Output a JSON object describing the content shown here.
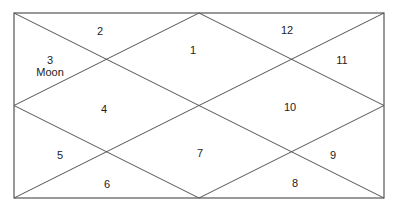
{
  "chart": {
    "type": "north-indian-horoscope",
    "line_color": "#555555",
    "frame": {
      "x1": 14,
      "y1": 13,
      "x2": 384,
      "y2": 198
    }
  },
  "houses": [
    {
      "number": "1",
      "planet": "",
      "x": 193,
      "y": 50
    },
    {
      "number": "2",
      "planet": "",
      "x": 100,
      "y": 31
    },
    {
      "number": "3",
      "planet": "Moon",
      "x": 50,
      "y": 66
    },
    {
      "number": "4",
      "planet": "",
      "x": 104,
      "y": 109
    },
    {
      "number": "5",
      "planet": "",
      "x": 60,
      "y": 155
    },
    {
      "number": "6",
      "planet": "",
      "x": 107,
      "y": 184
    },
    {
      "number": "7",
      "planet": "",
      "x": 200,
      "y": 153
    },
    {
      "number": "8",
      "planet": "",
      "x": 295,
      "y": 183
    },
    {
      "number": "9",
      "planet": "",
      "x": 333,
      "y": 155
    },
    {
      "number": "10",
      "planet": "",
      "x": 290,
      "y": 107
    },
    {
      "number": "11",
      "planet": "",
      "x": 342,
      "y": 60
    },
    {
      "number": "12",
      "planet": "",
      "x": 287,
      "y": 30
    }
  ]
}
